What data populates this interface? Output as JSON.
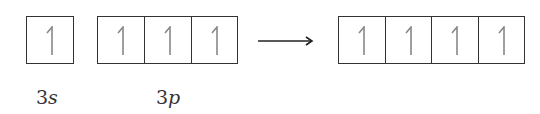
{
  "diagram": {
    "groups": [
      {
        "id": "3s",
        "label_num": "3",
        "label_sub": "s",
        "orbitals": [
          "up"
        ]
      },
      {
        "id": "3p",
        "label_num": "3",
        "label_sub": "p",
        "orbitals": [
          "up",
          "up",
          "up"
        ]
      },
      {
        "id": "hybrid",
        "label_num": "",
        "label_sub": "",
        "orbitals": [
          "up",
          "up",
          "up",
          "up"
        ]
      }
    ],
    "arrow": "right-arrow",
    "colors": {
      "border": "#333333",
      "spin": "#888888",
      "text": "#333333"
    }
  }
}
